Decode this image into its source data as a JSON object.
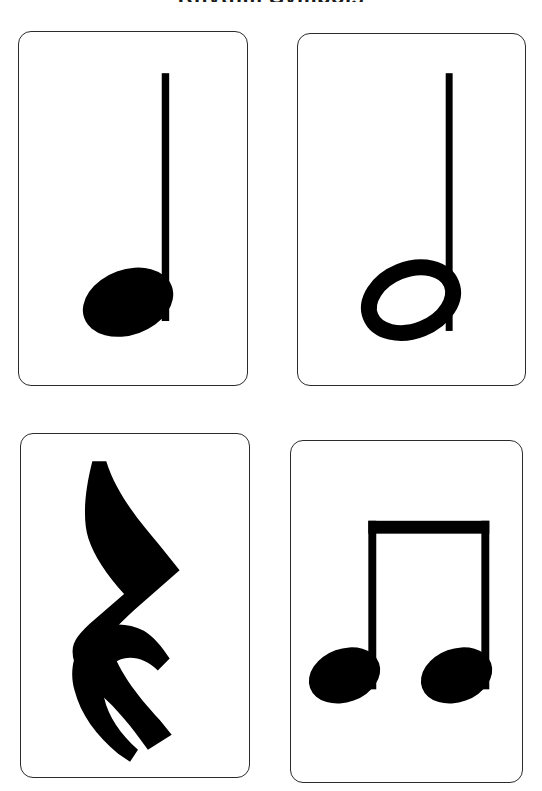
{
  "page": {
    "title_partial": "Rhythm Symbols",
    "background_color": "#ffffff",
    "ink_color": "#000000",
    "card_border_color": "#2b2b2b",
    "width": 542,
    "height": 791
  },
  "cards": [
    {
      "id": "quarter-note",
      "symbol_name": "quarter-note",
      "label": "Quarter Note",
      "notehead": "filled",
      "stem": "up",
      "beam": "none",
      "position": "top-left"
    },
    {
      "id": "half-note",
      "symbol_name": "half-note",
      "label": "Half Note",
      "notehead": "hollow",
      "stem": "up",
      "beam": "none",
      "position": "top-right"
    },
    {
      "id": "quarter-rest",
      "symbol_name": "quarter-rest",
      "label": "Quarter Rest",
      "notehead": "none",
      "stem": "none",
      "beam": "none",
      "position": "bottom-left"
    },
    {
      "id": "eighth-notes-beamed",
      "symbol_name": "beamed-eighth-notes",
      "label": "Eighth Notes",
      "notehead": "filled",
      "stem": "up",
      "beam": "single",
      "position": "bottom-right"
    }
  ]
}
